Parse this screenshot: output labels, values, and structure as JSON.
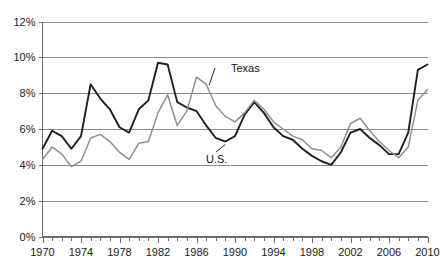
{
  "chart_data": {
    "type": "line",
    "title": "",
    "subtitle": "",
    "xlabel": "",
    "ylabel": "",
    "xlim": [
      1970,
      2010
    ],
    "ylim": [
      0,
      12
    ],
    "grid": true,
    "legend_position": "inline-annotation",
    "y_tick_labels": [
      "0%",
      "2%",
      "4%",
      "6%",
      "8%",
      "10%",
      "12%"
    ],
    "y_tick_values": [
      0,
      2,
      4,
      6,
      8,
      10,
      12
    ],
    "x_tick_labels": [
      "1970",
      "1974",
      "1978",
      "1982",
      "1986",
      "1990",
      "1994",
      "1998",
      "2002",
      "2006",
      "2010"
    ],
    "x_tick_values": [
      1970,
      1974,
      1978,
      1982,
      1986,
      1990,
      1994,
      1998,
      2002,
      2006,
      2010
    ],
    "x_minor_tick_step": 1,
    "x": [
      1970,
      1971,
      1972,
      1973,
      1974,
      1975,
      1976,
      1977,
      1978,
      1979,
      1980,
      1981,
      1982,
      1983,
      1984,
      1985,
      1986,
      1987,
      1988,
      1989,
      1990,
      1991,
      1992,
      1993,
      1994,
      1995,
      1996,
      1997,
      1998,
      1999,
      2000,
      2001,
      2002,
      2003,
      2004,
      2005,
      2006,
      2007,
      2008,
      2009,
      2010
    ],
    "series": [
      {
        "name": "U.S.",
        "color": "#1f1f1f",
        "stroke_width": 1.9,
        "values": [
          4.9,
          5.9,
          5.6,
          4.9,
          5.6,
          8.5,
          7.7,
          7.1,
          6.1,
          5.8,
          7.1,
          7.6,
          9.7,
          9.6,
          7.5,
          7.2,
          7.0,
          6.2,
          5.5,
          5.3,
          5.6,
          6.8,
          7.5,
          6.9,
          6.1,
          5.6,
          5.4,
          4.9,
          4.5,
          4.2,
          4.0,
          4.7,
          5.8,
          6.0,
          5.5,
          5.1,
          4.6,
          4.6,
          5.8,
          9.3,
          9.6
        ]
      },
      {
        "name": "Texas",
        "color": "#8f8f8f",
        "stroke_width": 1.5,
        "values": [
          4.3,
          5.0,
          4.6,
          3.9,
          4.2,
          5.5,
          5.7,
          5.3,
          4.7,
          4.3,
          5.2,
          5.3,
          6.9,
          7.9,
          6.2,
          7.0,
          8.9,
          8.5,
          7.3,
          6.7,
          6.4,
          6.9,
          7.6,
          7.1,
          6.4,
          6.0,
          5.6,
          5.4,
          4.9,
          4.8,
          4.4,
          5.0,
          6.3,
          6.6,
          5.9,
          5.3,
          4.8,
          4.4,
          5.0,
          7.6,
          8.2
        ]
      }
    ],
    "annotations": [
      {
        "text": "Texas",
        "series": "Texas",
        "anchor_year": 1987,
        "anchor_value": 8.5,
        "label_x": 231,
        "label_y": 72
      },
      {
        "text": "U.S.",
        "series": "U.S.",
        "anchor_year": 1989,
        "anchor_value": 5.3,
        "label_x": 206,
        "label_y": 163
      }
    ]
  }
}
